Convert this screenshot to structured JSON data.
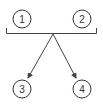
{
  "diagram": {
    "nodes": [
      {
        "id": "1",
        "label": "1",
        "cx": 22,
        "cy": 19,
        "r": 9
      },
      {
        "id": "2",
        "label": "2",
        "cx": 82,
        "cy": 19,
        "r": 9
      },
      {
        "id": "3",
        "label": "3",
        "cx": 22,
        "cy": 89,
        "r": 9
      },
      {
        "id": "4",
        "label": "4",
        "cx": 82,
        "cy": 89,
        "r": 9
      }
    ],
    "bracket": {
      "groups": [
        "1",
        "2"
      ],
      "x1": 6,
      "x2": 97,
      "y": 33,
      "tick": 5
    },
    "junction": {
      "x": 53,
      "y": 34
    },
    "edges": [
      {
        "from": "junction",
        "to": "3",
        "arrow": true
      },
      {
        "from": "junction",
        "to": "4",
        "arrow": true
      }
    ],
    "colors": {
      "stroke": "#333333",
      "background": "#ffffff"
    }
  }
}
